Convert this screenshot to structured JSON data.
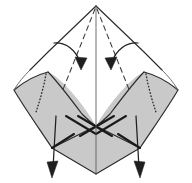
{
  "figure": {
    "title": "Origami fold step diagram",
    "background_color": "#ffffff",
    "paper_front_color": "#ffffff",
    "paper_shaded_color": "#c9c9c9",
    "line_color": "#2b2b2b",
    "arrow_color": "#1f1f1f",
    "canvas": {
      "width": 192,
      "height": 183
    }
  },
  "shapes": {
    "outer_kite": {
      "name": "outer-kite-outline",
      "apex_top": [
        96,
        6
      ],
      "left_corner": [
        11,
        88
      ],
      "right_corner": [
        181,
        88
      ],
      "bottom": [
        96,
        174
      ]
    },
    "left_shaded_flap": {
      "name": "left-shaded-flap",
      "fill": "#c9c9c9"
    },
    "right_shaded_flap": {
      "name": "right-shaded-flap",
      "fill": "#c9c9c9"
    },
    "bottom_shaded_diamond": {
      "name": "bottom-shaded-diamond",
      "fill": "#c9c9c9"
    },
    "center_vertical_crease": {
      "name": "center-vertical-crease",
      "from": [
        96,
        6
      ],
      "to": [
        96,
        174
      ]
    },
    "center_crossing": {
      "name": "center-x-crossing",
      "point": [
        96,
        126
      ]
    }
  },
  "creases": {
    "valley_left": {
      "name": "valley-crease-left",
      "style": "dashed",
      "from": [
        96,
        8
      ],
      "to": [
        62,
        92
      ]
    },
    "valley_right": {
      "name": "valley-crease-right",
      "style": "dashed",
      "from": [
        96,
        8
      ],
      "to": [
        130,
        92
      ]
    },
    "hidden_left": {
      "name": "hidden-crease-left",
      "style": "dotted"
    },
    "hidden_right": {
      "name": "hidden-crease-right",
      "style": "dotted"
    }
  },
  "arrows": [
    {
      "name": "fold-arrow-left",
      "type": "curved",
      "direction": "down-right",
      "start": [
        55,
        44
      ],
      "end": [
        81,
        66
      ],
      "label": ""
    },
    {
      "name": "fold-arrow-right",
      "type": "curved",
      "direction": "down-left",
      "start": [
        137,
        44
      ],
      "end": [
        111,
        66
      ],
      "label": ""
    },
    {
      "name": "pull-arrow-left",
      "type": "straight",
      "direction": "down",
      "start": [
        55,
        118
      ],
      "end": [
        53,
        176
      ],
      "label": ""
    },
    {
      "name": "pull-arrow-right",
      "type": "straight",
      "direction": "down",
      "start": [
        137,
        118
      ],
      "end": [
        139,
        176
      ],
      "label": ""
    }
  ]
}
